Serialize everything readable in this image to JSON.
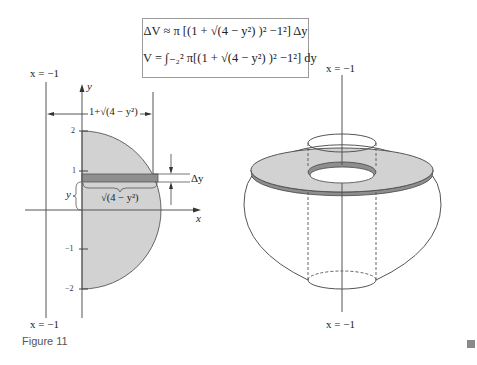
{
  "formulas": {
    "delta_v": "ΔV ≈ π [(1 + √(4 − y²) )² −1²] Δy",
    "volume": "V = ∫₋₂² π[(1 + √(4 − y²) )² −1²] dy"
  },
  "left_panel": {
    "line_label_top": "x = −1",
    "line_label_bottom": "x = −1",
    "y_axis_label": "y",
    "x_axis_label": "x",
    "width_label": "1+√(4 − y²)",
    "strip_width_label": "√(4 − y²)",
    "strip_height_label": "y",
    "delta_label": "Δy",
    "ticks": [
      "2",
      "1",
      "−1",
      "−2"
    ]
  },
  "right_panel": {
    "axis_label_top": "x = −1",
    "axis_label_bottom": "x = −1"
  },
  "caption": "Figure 11",
  "colors": {
    "region_fill": "#d2d2d2",
    "strip_fill": "#8e8e8e",
    "line": "#555555"
  }
}
